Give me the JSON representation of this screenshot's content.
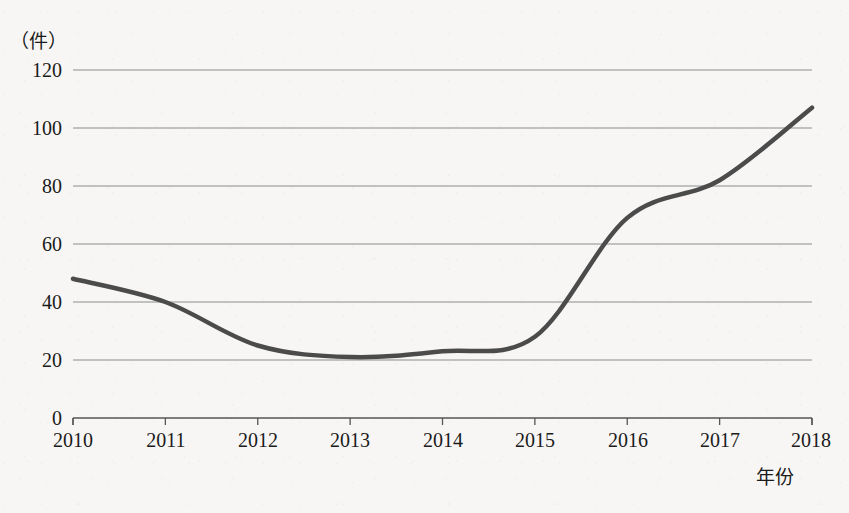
{
  "chart_data": {
    "type": "line",
    "title": "",
    "subtitle": "",
    "xlabel": "年份",
    "ylabel": "（件）",
    "x": [
      2010,
      2011,
      2012,
      2013,
      2014,
      2015,
      2016,
      2017,
      2018
    ],
    "categories": [
      "2010",
      "2011",
      "2012",
      "2013",
      "2014",
      "2015",
      "2016",
      "2017",
      "2018"
    ],
    "values": [
      48,
      40,
      25,
      21,
      23,
      28,
      69,
      82,
      107
    ],
    "series": [
      {
        "name": "件数",
        "values": [
          48,
          40,
          25,
          21,
          23,
          28,
          69,
          82,
          107
        ]
      }
    ],
    "xlim": [
      2010,
      2018
    ],
    "ylim": [
      0,
      120
    ],
    "yticks": [
      0,
      20,
      40,
      60,
      80,
      100,
      120
    ],
    "ytick_labels": [
      "0",
      "20",
      "40",
      "60",
      "80",
      "100",
      "120"
    ],
    "xticks": [
      2010,
      2011,
      2012,
      2013,
      2014,
      2015,
      2016,
      2017,
      2018
    ],
    "xtick_labels": [
      "2010",
      "2011",
      "2012",
      "2013",
      "2014",
      "2015",
      "2016",
      "2017",
      "2018"
    ],
    "grid": "horizontal",
    "legend": "none",
    "smooth": true,
    "line_color": "#4b4b4b",
    "line_width": 4.5,
    "grid_color": "#8c8c8c",
    "axis_color": "#555555",
    "background_color": "#f7f6f4",
    "annotations": []
  }
}
